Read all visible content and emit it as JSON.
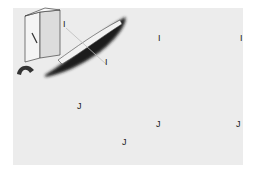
{
  "figure": {
    "background": "#ffffff",
    "panel_color": "#ececec",
    "top_row": {
      "section_label": "I",
      "section_label_right": "I",
      "object_label_top": "I",
      "object_label_bottom": "I",
      "description": "Prism with single diagonal mark, elongated dark shape cut by plane I-I; cross-section shows V-groove with shaded block"
    },
    "bottom_row": {
      "section_label": "J",
      "section_label_right": "J",
      "object_label_top": "J",
      "object_label_bottom": "J",
      "description": "Prism with cross mark, elongated dark shape with twisted segments cut by plane J-J; cross-section shows V-groove with two shaded blocks"
    },
    "colors": {
      "dark_fill": "#1a1a1a",
      "mid_fill": "#555555",
      "light_fill": "#8a8a8a",
      "line": "#333333",
      "hatch": "#9a9a9a"
    }
  }
}
